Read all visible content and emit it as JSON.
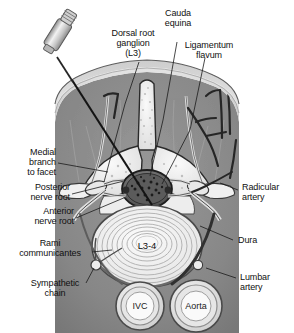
{
  "figure": {
    "center_label": "L3-4",
    "colors": {
      "skin": "#d9d9d9",
      "fat": "#cfcfcf",
      "muscle": "#8c8c8c",
      "deep_muscle": "#7a7a7a",
      "bone": "#efefef",
      "bone_outline": "#2b2b2b",
      "disc": "#f2f2f2",
      "dura": "#3a3a3a",
      "vessel_dark": "#2e2e2e",
      "background": "#ffffff",
      "text": "#101010",
      "leader": "#1a1a1a"
    }
  },
  "labels": {
    "cauda_equina": "Cauda\nequina",
    "dorsal_root_ganglion": "Dorsal root\nganglion\n(L3)",
    "ligamentum_flavum": "Ligamentum\nflavum",
    "medial_branch_to_facet": "Medial\nbranch\nto facet",
    "posterior_nerve_root": "Posterior\nnerve root",
    "anterior_nerve_root": "Anterior\nnerve root",
    "rami_communicantes": "Rami\ncommunicantes",
    "sympathetic_chain": "Sympathetic\nchain",
    "radicular_artery": "Radicular\nartery",
    "dura": "Dura",
    "lumbar_artery": "Lumbar\nartery"
  },
  "vessels": {
    "ivc": "IVC",
    "aorta": "Aorta"
  }
}
